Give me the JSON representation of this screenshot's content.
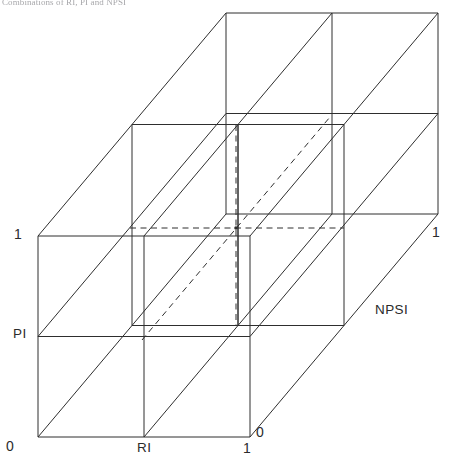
{
  "figure": {
    "caption": "Combinations of RI, PI and NPSI",
    "type": "3d-cube-diagram",
    "axes": [
      {
        "id": "x",
        "label": "RI",
        "min": "0",
        "max": "1"
      },
      {
        "id": "y",
        "label": "PI",
        "min": "0",
        "max": "1"
      },
      {
        "id": "z",
        "label": "NPSI",
        "min": "0",
        "max": "1"
      }
    ],
    "axis_labels": {
      "x": "RI",
      "y": "PI",
      "z": "NPSI"
    },
    "tick_labels": {
      "origin": "0",
      "y_max": "1",
      "x_max": "1",
      "z_origin": "0",
      "z_max": "1"
    },
    "geometry": {
      "front_left": 38,
      "front_right": 250,
      "front_top": 236,
      "front_bottom": 437,
      "depth_dx": 188,
      "depth_dy": -223,
      "center_point": [
        236,
        228
      ],
      "subdivisions": 2
    },
    "colors": {
      "stroke": "#2e2e2e",
      "inner_stroke": "#3a3a3a",
      "background": "#ffffff",
      "text": "#2b2b2b",
      "caption": "#5d5d63"
    },
    "line_styles": {
      "visible": "solid",
      "hidden": "dashed"
    }
  }
}
